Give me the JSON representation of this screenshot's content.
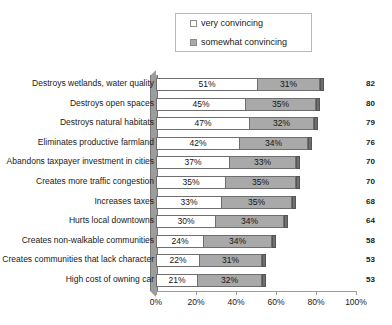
{
  "legend": {
    "items": [
      {
        "label": "very convincing",
        "swatch": "white-swatch-icon",
        "color": "#ffffff"
      },
      {
        "label": "somewhat convincing",
        "swatch": "gray-swatch-icon",
        "color": "#a9a9a9"
      }
    ]
  },
  "chart_data": {
    "type": "bar",
    "title": "",
    "subtitle": "",
    "xlabel": "",
    "ylabel": "",
    "orientation": "horizontal",
    "stacked": true,
    "grid": false,
    "legend_position": "top-center",
    "xlim": [
      0,
      100
    ],
    "xticks": [
      "0%",
      "20%",
      "40%",
      "60%",
      "80%",
      "100%"
    ],
    "xtick_values": [
      0,
      20,
      40,
      60,
      80,
      100
    ],
    "categories": [
      "Destroys wetlands, water quality",
      "Destroys open spaces",
      "Destroys natural habitats",
      "Eliminates productive farmland",
      "Abandons taxpayer investment in cities",
      "Creates more traffic congestion",
      "Increases taxes",
      "Hurts local downtowns",
      "Creates non-walkable communities",
      "Creates communities that lack character",
      "High cost of owning car"
    ],
    "series": [
      {
        "name": "very convincing",
        "color": "#ffffff",
        "values": [
          51,
          45,
          47,
          42,
          37,
          35,
          33,
          30,
          24,
          22,
          21
        ],
        "labels": [
          "51%",
          "45%",
          "47%",
          "42%",
          "37%",
          "35%",
          "33%",
          "30%",
          "24%",
          "22%",
          "21%"
        ]
      },
      {
        "name": "somewhat convincing",
        "color": "#a9a9a9",
        "values": [
          31,
          35,
          32,
          34,
          33,
          35,
          35,
          34,
          34,
          31,
          32
        ],
        "labels": [
          "31%",
          "35%",
          "32%",
          "34%",
          "33%",
          "35%",
          "35%",
          "34%",
          "34%",
          "31%",
          "32%"
        ]
      }
    ],
    "totals": [
      82,
      80,
      79,
      76,
      70,
      70,
      68,
      64,
      58,
      53,
      53
    ],
    "total_labels": [
      "82",
      "80",
      "79",
      "76",
      "70",
      "70",
      "68",
      "64",
      "58",
      "53",
      "53"
    ]
  }
}
